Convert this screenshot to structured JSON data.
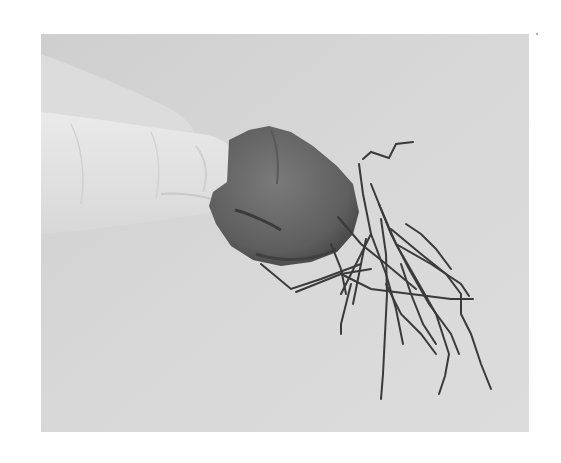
{
  "image": {
    "description": "Grayscale photograph of a hand holding a magnetic rock (lodestone) with iron wires/nails clinging to it",
    "subject": "lodestone with attached iron wires",
    "colors": {
      "background": "#d4d4d4",
      "background_light": "#dedede",
      "hand": "#e6e6e6",
      "hand_shadow": "#c4c4c4",
      "rock": "#6a6a6a",
      "rock_dark": "#4a4a4a",
      "wire": "#3a3a3a"
    }
  }
}
